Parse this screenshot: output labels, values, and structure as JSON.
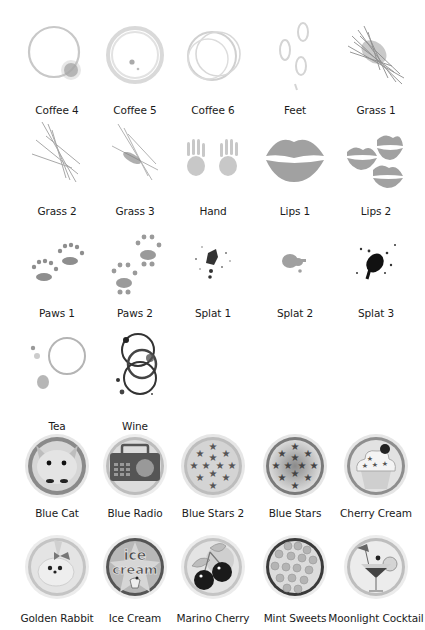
{
  "sections": {
    "stains": {
      "items": [
        {
          "label": "Coffee 4",
          "icon": "coffee-stain-icon"
        },
        {
          "label": "Coffee 5",
          "icon": "coffee-stain-icon"
        },
        {
          "label": "Coffee 6",
          "icon": "coffee-stain-icon"
        },
        {
          "label": "Feet",
          "icon": "footprints-icon"
        },
        {
          "label": "Grass 1",
          "icon": "grass-icon"
        },
        {
          "label": "Grass 2",
          "icon": "grass-icon"
        },
        {
          "label": "Grass 3",
          "icon": "grass-icon"
        },
        {
          "label": "Hand",
          "icon": "handprints-icon"
        },
        {
          "label": "Lips 1",
          "icon": "lips-icon"
        },
        {
          "label": "Lips 2",
          "icon": "lips-icon"
        },
        {
          "label": "Paws 1",
          "icon": "paw-prints-icon"
        },
        {
          "label": "Paws 2",
          "icon": "paw-prints-icon"
        },
        {
          "label": "Splat 1",
          "icon": "splat-icon"
        },
        {
          "label": "Splat 2",
          "icon": "splat-icon"
        },
        {
          "label": "Splat 3",
          "icon": "splat-icon"
        },
        {
          "label": "Tea",
          "icon": "tea-stain-icon"
        },
        {
          "label": "Wine",
          "icon": "wine-stain-icon"
        }
      ]
    },
    "badges": {
      "items": [
        {
          "label": "Blue Cat",
          "icon": "cat-badge-icon"
        },
        {
          "label": "Blue Radio",
          "icon": "radio-badge-icon"
        },
        {
          "label": "Blue Stars 2",
          "icon": "stars-badge-icon"
        },
        {
          "label": "Blue Stars",
          "icon": "stars-badge-icon"
        },
        {
          "label": "Cherry Cream",
          "icon": "cupcake-badge-icon"
        },
        {
          "label": "Golden Rabbit",
          "icon": "rabbit-badge-icon"
        },
        {
          "label": "Ice Cream",
          "icon": "ice-cream-badge-icon"
        },
        {
          "label": "Marino Cherry",
          "icon": "cherry-badge-icon"
        },
        {
          "label": "Mint Sweets",
          "icon": "sweets-badge-icon"
        },
        {
          "label": "Moonlight Cocktail",
          "icon": "cocktail-badge-icon"
        }
      ],
      "ice_cream_text": [
        "ice",
        "cream"
      ]
    }
  }
}
